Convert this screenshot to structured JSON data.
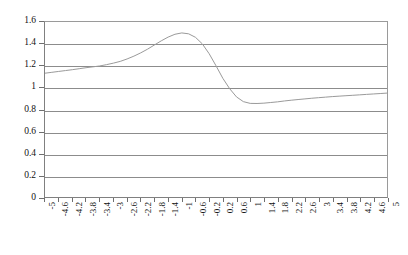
{
  "chart_data": {
    "type": "line",
    "title": "",
    "subtitle": "",
    "xlabel": "",
    "ylabel": "",
    "xlim": [
      -5,
      5
    ],
    "ylim": [
      0,
      1.6
    ],
    "grid": true,
    "grid_axis": "y",
    "legend": false,
    "legend_position": "none",
    "line_color": "#9a9a9a",
    "grid_color": "#8c8c8c",
    "axis_color": "#808080",
    "background_color": "#ffffff",
    "y_ticks": [
      0,
      0.2,
      0.4,
      0.6,
      0.8,
      1,
      1.2,
      1.4,
      1.6
    ],
    "y_tick_labels": [
      "0",
      "0.2",
      "0.4",
      "0.6",
      "0.8",
      "1",
      "1.2",
      "1.4",
      "1.6"
    ],
    "x_ticks": [
      -5,
      -4.6,
      -4.2,
      -3.8,
      -3.4,
      -3,
      -2.6,
      -2.2,
      -1.8,
      -1.4,
      -1,
      -0.6,
      -0.2,
      0.2,
      0.6,
      1,
      1.4,
      1.8,
      2.2,
      2.6,
      3,
      3.4,
      3.8,
      4.2,
      4.6,
      5
    ],
    "x_tick_labels": [
      "-5",
      "-4.6",
      "-4.2",
      "-3.8",
      "-3.4",
      "-3",
      "-2.6",
      "-2.2",
      "-1.8",
      "-1.4",
      "-1",
      "-0.6",
      "-0.2",
      "0.2",
      "0.6",
      "1",
      "1.4",
      "1.8",
      "2.2",
      "2.6",
      "3",
      "3.4",
      "3.8",
      "4.2",
      "4.6",
      "5"
    ],
    "x_tick_rotation": -90,
    "series": [
      {
        "name": "series-1",
        "color": "#9a9a9a",
        "x": [
          -5,
          -4.8,
          -4.6,
          -4.4,
          -4.2,
          -4,
          -3.8,
          -3.6,
          -3.4,
          -3.2,
          -3,
          -2.8,
          -2.6,
          -2.4,
          -2.2,
          -2,
          -1.8,
          -1.6,
          -1.4,
          -1.2,
          -1,
          -0.8,
          -0.6,
          -0.4,
          -0.2,
          0,
          0.2,
          0.4,
          0.6,
          0.8,
          1,
          1.2,
          1.4,
          1.6,
          1.8,
          2,
          2.2,
          2.4,
          2.6,
          2.8,
          3,
          3.2,
          3.4,
          3.6,
          3.8,
          4,
          4.2,
          4.4,
          4.6,
          4.8,
          5
        ],
        "y": [
          1.132,
          1.14,
          1.148,
          1.156,
          1.164,
          1.173,
          1.182,
          1.19,
          1.198,
          1.21,
          1.224,
          1.24,
          1.262,
          1.288,
          1.318,
          1.352,
          1.39,
          1.428,
          1.462,
          1.488,
          1.5,
          1.492,
          1.46,
          1.4,
          1.31,
          1.2,
          1.085,
          0.99,
          0.915,
          0.872,
          0.856,
          0.855,
          0.858,
          0.864,
          0.87,
          0.878,
          0.885,
          0.891,
          0.897,
          0.903,
          0.908,
          0.913,
          0.918,
          0.922,
          0.926,
          0.93,
          0.934,
          0.938,
          0.942,
          0.946,
          0.95
        ]
      }
    ],
    "annotations": []
  }
}
